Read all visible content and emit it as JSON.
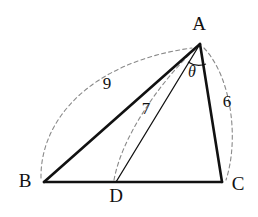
{
  "figure": {
    "type": "geometry-diagram",
    "background_color": "#ffffff",
    "stroke_color": "#111111",
    "dash_color": "#8a8a8a",
    "vertices": [
      {
        "id": "A",
        "label": "A",
        "x": 200,
        "y": 44,
        "label_x": 199,
        "label_y": 26
      },
      {
        "id": "B",
        "label": "B",
        "x": 44,
        "y": 182,
        "label_x": 25,
        "label_y": 183
      },
      {
        "id": "C",
        "label": "C",
        "x": 222,
        "y": 182,
        "label_x": 238,
        "label_y": 186
      },
      {
        "id": "D",
        "label": "D",
        "x": 116,
        "y": 182,
        "label_x": 116,
        "label_y": 198
      }
    ],
    "solid_edges": [
      {
        "name": "edge-BC",
        "from": "B",
        "to": "C",
        "width": 2.6
      },
      {
        "name": "edge-AB",
        "from": "A",
        "to": "B",
        "width": 2.6
      },
      {
        "name": "edge-AC",
        "from": "A",
        "to": "C",
        "width": 2.6
      },
      {
        "name": "edge-AD",
        "from": "A",
        "to": "D",
        "width": 1.3
      }
    ],
    "measure_arcs": [
      {
        "name": "measure-arc-AB",
        "from": "B",
        "to": "A",
        "value": "9",
        "label_x": 107,
        "label_y": 85,
        "path": "M 41 178 C 40 120 90 62 192 48"
      },
      {
        "name": "measure-arc-AD",
        "from": "D",
        "to": "A",
        "value": "7",
        "label_x": 146,
        "label_y": 110,
        "path": "M 114 180 C 122 136 160 82 196 48"
      },
      {
        "name": "measure-arc-AC",
        "from": "A",
        "to": "C",
        "value": "6",
        "label_x": 227,
        "label_y": 103,
        "path": "M 204 48 C 232 78 239 140 226 180"
      }
    ],
    "angle_marks": [
      {
        "name": "angle-DAC",
        "vertex": "A",
        "label": "θ",
        "label_x": 192,
        "label_y": 73,
        "arc_path": "M 188 62 A 20 20 0 0 0 206 64"
      }
    ],
    "lengths": {
      "AB": "9",
      "AD": "7",
      "AC": "6"
    },
    "angle": {
      "symbol": "θ",
      "between": "AD and AC"
    }
  }
}
